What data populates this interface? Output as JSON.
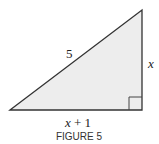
{
  "figure": {
    "caption": "FIGURE 5",
    "shape": "right-triangle",
    "fill_color": "#ededed",
    "stroke_color": "#333333",
    "labels": {
      "hypotenuse": "5",
      "vertical_leg": "x",
      "horizontal_leg_var": "x",
      "horizontal_leg_rest": " + 1"
    },
    "right_angle_marker": "bottom-right"
  }
}
